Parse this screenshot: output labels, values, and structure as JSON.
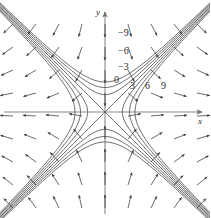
{
  "figure": {
    "title": "",
    "background_color": "#ffffff",
    "curve_color": "#5a5a5a",
    "axis_color": "#6e6e6e",
    "arrow_color": "#3a3a3a",
    "label_color": "#2b2b2b",
    "width": 210,
    "height": 218
  },
  "axes": {
    "x_label": "x",
    "y_label": "y",
    "origin": {
      "x": 105,
      "y": 112
    },
    "x_arrow_tip": {
      "x": 205,
      "y": 112
    },
    "y_arrow_tip": {
      "x": 105,
      "y": 10
    }
  },
  "chart_data": {
    "type": "line",
    "xlabel": "x",
    "ylabel": "y",
    "grid": false,
    "legend_position": "none",
    "xlim": [
      -10.5,
      10.5
    ],
    "ylim": [
      -10.9,
      10.9
    ],
    "function": "f(x,y) = x^2 - y^2",
    "contour_levels": [
      -9,
      -6,
      -3,
      0,
      3,
      6,
      9
    ],
    "level_labels": [
      {
        "text": "−9",
        "value": -9,
        "left": 118,
        "top": 28
      },
      {
        "text": "−6",
        "value": -6,
        "left": 118,
        "top": 46
      },
      {
        "text": "−3",
        "value": -3,
        "left": 118,
        "top": 62
      },
      {
        "text": "0",
        "value": 0,
        "left": 114,
        "top": 75
      },
      {
        "text": "3",
        "value": 3,
        "left": 130,
        "top": 81
      },
      {
        "text": "6",
        "value": 6,
        "left": 145,
        "top": 81
      },
      {
        "text": "9",
        "value": 9,
        "left": 161,
        "top": 81
      }
    ],
    "axis_labels": [
      {
        "text": "y",
        "left": 96,
        "top": 8
      },
      {
        "text": "x",
        "left": 198,
        "top": 117
      }
    ],
    "vector_field": {
      "description": "gradient of f, grad f = (2x, -2y), arrows perpendicular to level curves",
      "arrow_count": 96,
      "arrow_style": "thin line with small solid arrowhead"
    },
    "series": [
      {
        "name": "level -9",
        "value": -9,
        "branches": 2,
        "orientation": "opens-vertically"
      },
      {
        "name": "level -6",
        "value": -6,
        "branches": 2,
        "orientation": "opens-vertically"
      },
      {
        "name": "level -3",
        "value": -3,
        "branches": 2,
        "orientation": "opens-vertically"
      },
      {
        "name": "level 0",
        "value": 0,
        "branches": 2,
        "orientation": "diagonal-lines y=x and y=-x"
      },
      {
        "name": "level 3",
        "value": 3,
        "branches": 2,
        "orientation": "opens-horizontally"
      },
      {
        "name": "level 6",
        "value": 6,
        "branches": 2,
        "orientation": "opens-horizontally"
      },
      {
        "name": "level 9",
        "value": 9,
        "branches": 2,
        "orientation": "opens-horizontally"
      }
    ]
  }
}
